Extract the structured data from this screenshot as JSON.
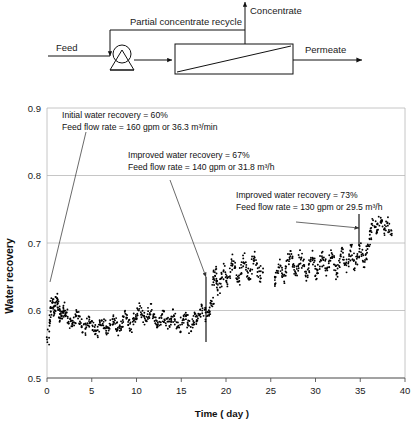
{
  "figure": {
    "diagram": {
      "title": "reverse-osmosis-flow-diagram",
      "labels": {
        "feed": "Feed",
        "recycle": "Partial concentrate recycle",
        "concentrate": "Concentrate",
        "permeate": "Permeate"
      },
      "icons": {
        "pump": "pump-icon",
        "module": "membrane-module-icon",
        "arrow": "flow-arrow-icon"
      }
    }
  },
  "chart_data": {
    "type": "scatter",
    "title": "",
    "xlabel": "Time ( day )",
    "ylabel": "Water recovery",
    "xlim": [
      0,
      40
    ],
    "ylim": [
      0.5,
      0.9
    ],
    "xticks": [
      0,
      5,
      10,
      15,
      20,
      25,
      30,
      35,
      40
    ],
    "xtick_labels": [
      "0",
      "5",
      "10",
      "15",
      "20",
      "25",
      "30",
      "35",
      "40"
    ],
    "yticks": [
      0.5,
      0.6,
      0.7,
      0.8,
      0.9
    ],
    "ytick_labels": [
      "0.5",
      "0.6",
      "0.7",
      "0.8",
      "0.9"
    ],
    "grid": "horizontal",
    "legend": "none",
    "marker": "black-dot",
    "series": [
      {
        "name": "Water recovery",
        "x": [
          0.1,
          0.2,
          0.3,
          0.4,
          0.5,
          0.6,
          0.7,
          0.8,
          0.9,
          1.0,
          1.1,
          1.2,
          1.3,
          1.4,
          1.5,
          1.6,
          1.7,
          1.8,
          1.9,
          2.0,
          2.2,
          2.4,
          2.6,
          2.8,
          3.0,
          3.2,
          3.4,
          3.6,
          3.8,
          4.0,
          4.2,
          4.4,
          4.6,
          4.8,
          5.0,
          5.2,
          5.4,
          5.6,
          5.8,
          6.0,
          6.2,
          6.4,
          6.6,
          6.8,
          7.0,
          7.2,
          7.4,
          7.6,
          7.8,
          8.0,
          8.2,
          8.4,
          8.6,
          8.8,
          9.0,
          9.2,
          9.4,
          9.6,
          9.8,
          10.0,
          10.2,
          10.4,
          10.6,
          10.8,
          11.0,
          11.2,
          11.4,
          11.6,
          11.8,
          12.0,
          12.2,
          12.4,
          12.6,
          12.8,
          13.0,
          13.2,
          13.4,
          13.6,
          13.8,
          14.0,
          14.2,
          14.4,
          14.6,
          14.8,
          15.0,
          15.2,
          15.4,
          15.6,
          15.8,
          16.0,
          16.2,
          16.4,
          16.6,
          16.8,
          17.0,
          17.2,
          17.4,
          17.6,
          17.8,
          18.0,
          18.2,
          18.4,
          18.5,
          18.6,
          18.7,
          18.8,
          18.9,
          19.0,
          19.2,
          19.4,
          19.6,
          19.8,
          20.0,
          20.2,
          20.4,
          20.6,
          20.8,
          21.0,
          21.2,
          21.4,
          21.6,
          21.8,
          22.0,
          22.2,
          22.4,
          22.6,
          22.8,
          23.0,
          23.2,
          23.4,
          23.6,
          23.8,
          24.0,
          25.4,
          25.6,
          25.8,
          26.0,
          26.2,
          26.4,
          26.6,
          26.8,
          27.0,
          27.2,
          27.4,
          27.6,
          27.8,
          28.0,
          28.2,
          28.4,
          28.6,
          28.8,
          29.0,
          29.2,
          29.4,
          29.6,
          29.8,
          30.0,
          30.2,
          30.4,
          30.6,
          30.8,
          31.0,
          31.2,
          31.4,
          31.6,
          31.8,
          32.0,
          32.2,
          32.4,
          32.6,
          32.8,
          33.0,
          33.2,
          33.4,
          33.6,
          33.8,
          34.0,
          34.2,
          34.4,
          34.6,
          34.8,
          35.0,
          35.2,
          35.4,
          35.6,
          35.8,
          36.0,
          36.1,
          36.2,
          36.4,
          36.6,
          36.8,
          37.0,
          37.2,
          37.4,
          37.6,
          37.8,
          38.0,
          38.2,
          38.4
        ],
        "y": [
          0.555,
          0.575,
          0.592,
          0.601,
          0.608,
          0.613,
          0.606,
          0.598,
          0.604,
          0.612,
          0.617,
          0.609,
          0.601,
          0.596,
          0.59,
          0.585,
          0.592,
          0.598,
          0.604,
          0.6,
          0.594,
          0.587,
          0.581,
          0.576,
          0.583,
          0.589,
          0.594,
          0.586,
          0.58,
          0.575,
          0.571,
          0.578,
          0.584,
          0.589,
          0.583,
          0.577,
          0.572,
          0.568,
          0.574,
          0.58,
          0.585,
          0.579,
          0.573,
          0.569,
          0.576,
          0.582,
          0.587,
          0.581,
          0.575,
          0.57,
          0.577,
          0.583,
          0.588,
          0.592,
          0.586,
          0.58,
          0.575,
          0.582,
          0.588,
          0.594,
          0.599,
          0.604,
          0.597,
          0.59,
          0.584,
          0.591,
          0.597,
          0.602,
          0.595,
          0.589,
          0.583,
          0.577,
          0.584,
          0.59,
          0.595,
          0.588,
          0.582,
          0.576,
          0.583,
          0.589,
          0.594,
          0.587,
          0.581,
          0.575,
          0.582,
          0.588,
          0.593,
          0.586,
          0.58,
          0.574,
          0.581,
          0.587,
          0.592,
          0.585,
          0.592,
          0.598,
          0.604,
          0.597,
          0.591,
          0.596,
          0.602,
          0.608,
          0.612,
          0.64,
          0.655,
          0.66,
          0.648,
          0.636,
          0.628,
          0.642,
          0.654,
          0.662,
          0.65,
          0.641,
          0.656,
          0.668,
          0.675,
          0.663,
          0.652,
          0.645,
          0.658,
          0.67,
          0.678,
          0.666,
          0.655,
          0.648,
          0.661,
          0.672,
          0.68,
          0.668,
          0.657,
          0.65,
          0.662,
          0.64,
          0.652,
          0.663,
          0.671,
          0.659,
          0.648,
          0.656,
          0.668,
          0.676,
          0.684,
          0.672,
          0.661,
          0.653,
          0.665,
          0.675,
          0.683,
          0.671,
          0.66,
          0.652,
          0.664,
          0.674,
          0.682,
          0.67,
          0.659,
          0.651,
          0.663,
          0.673,
          0.681,
          0.669,
          0.658,
          0.666,
          0.677,
          0.685,
          0.673,
          0.662,
          0.654,
          0.667,
          0.678,
          0.686,
          0.674,
          0.663,
          0.671,
          0.682,
          0.69,
          0.678,
          0.667,
          0.675,
          0.686,
          0.694,
          0.682,
          0.671,
          0.679,
          0.69,
          0.7,
          0.712,
          0.724,
          0.733,
          0.728,
          0.719,
          0.726,
          0.734,
          0.727,
          0.718,
          0.724,
          0.731,
          0.722,
          0.715
        ]
      }
    ],
    "annotations": [
      {
        "id": "annotation-initial",
        "lines": [
          "Initial water recovery = 60%",
          "Feed flow rate = 160 gpm or 36.3 m³/min"
        ]
      },
      {
        "id": "annotation-improved-67",
        "lines": [
          "Improved water recovery = 67%",
          "Feed flow rate = 140 gpm or 31.8 m³/h"
        ]
      },
      {
        "id": "annotation-improved-73",
        "lines": [
          "Improved water recovery = 73%",
          "Feed flow rate = 130 gpm or 29.5 m³/h"
        ]
      }
    ],
    "colors": {
      "marker": "#000000",
      "grid": "#b8b8b8",
      "axis": "#808080",
      "text": "#111111",
      "background": "#ffffff"
    }
  }
}
